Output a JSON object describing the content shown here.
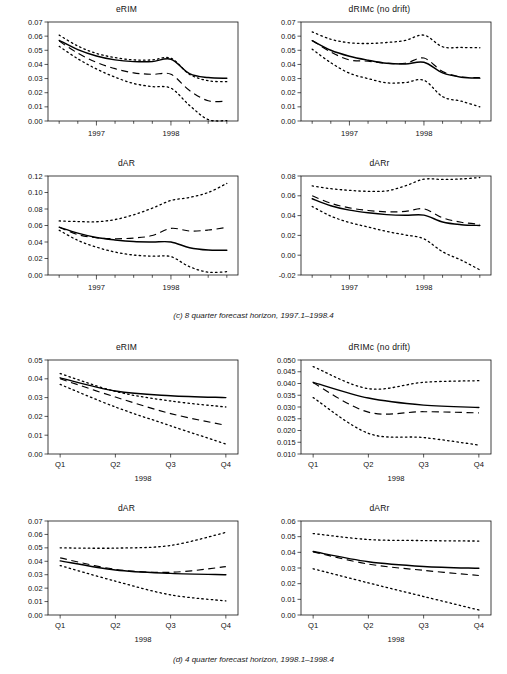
{
  "figure": {
    "captions": [
      "(c) 8 quarter forecast horizon, 1997.1–1998.4",
      "(d) 4 quarter forecast horizon, 1998.1–1998.4"
    ]
  },
  "chart_data": [
    {
      "id": "panel-c-erim",
      "type": "line",
      "title": "eRIM",
      "xlabel": "",
      "ylabel": "",
      "grid": false,
      "legend": "none",
      "x": [
        1996.5,
        1996.75,
        1997.0,
        1997.25,
        1997.5,
        1997.75,
        1998.0,
        1998.25,
        1998.5,
        1998.75
      ],
      "xtick_values": [
        1997.0,
        1998.0
      ],
      "xtick_labels": [
        "1997",
        "1998"
      ],
      "xlim": [
        1996.35,
        1998.9
      ],
      "ylim": [
        0.0,
        0.07
      ],
      "ytick_values": [
        0.0,
        0.01,
        0.02,
        0.03,
        0.04,
        0.05,
        0.06,
        0.07
      ],
      "ytick_labels": [
        "0.00",
        "0.01",
        "0.02",
        "0.03",
        "0.04",
        "0.05",
        "0.06",
        "0.07"
      ],
      "series": [
        {
          "name": "median",
          "style": "solid",
          "values": [
            0.057,
            0.0505,
            0.046,
            0.0432,
            0.042,
            0.042,
            0.0437,
            0.0335,
            0.0307,
            0.0302
          ]
        },
        {
          "name": "mean",
          "style": "dashed",
          "values": [
            0.0565,
            0.048,
            0.0415,
            0.037,
            0.034,
            0.033,
            0.033,
            0.0215,
            0.0143,
            0.014
          ]
        },
        {
          "name": "upper",
          "style": "dotted",
          "values": [
            0.0607,
            0.053,
            0.0478,
            0.0448,
            0.0432,
            0.0432,
            0.0444,
            0.033,
            0.0285,
            0.0278
          ]
        },
        {
          "name": "lower",
          "style": "dotted",
          "values": [
            0.0528,
            0.044,
            0.0368,
            0.031,
            0.0265,
            0.0243,
            0.0232,
            0.011,
            0.001,
            0.0003
          ]
        }
      ]
    },
    {
      "id": "panel-c-drimc",
      "type": "line",
      "title": "dRIMc (no drift)",
      "xlabel": "",
      "ylabel": "",
      "grid": false,
      "legend": "none",
      "x": [
        1996.5,
        1996.75,
        1997.0,
        1997.25,
        1997.5,
        1997.75,
        1998.0,
        1998.25,
        1998.5,
        1998.75
      ],
      "xtick_values": [
        1997.0,
        1998.0
      ],
      "xtick_labels": [
        "1997",
        "1998"
      ],
      "xlim": [
        1996.35,
        1998.9
      ],
      "ylim": [
        0.0,
        0.07
      ],
      "ytick_values": [
        0.0,
        0.01,
        0.02,
        0.03,
        0.04,
        0.05,
        0.06,
        0.07
      ],
      "ytick_labels": [
        "0.00",
        "0.01",
        "0.02",
        "0.03",
        "0.04",
        "0.05",
        "0.06",
        "0.07"
      ],
      "series": [
        {
          "name": "median",
          "style": "solid",
          "values": [
            0.0568,
            0.05,
            0.0458,
            0.043,
            0.0408,
            0.0403,
            0.0415,
            0.034,
            0.031,
            0.0303
          ]
        },
        {
          "name": "mean",
          "style": "dashed",
          "values": [
            0.057,
            0.0488,
            0.0432,
            0.0423,
            0.0408,
            0.0408,
            0.0445,
            0.035,
            0.0312,
            0.0307
          ]
        },
        {
          "name": "upper",
          "style": "dotted",
          "values": [
            0.063,
            0.0578,
            0.0553,
            0.0548,
            0.0555,
            0.057,
            0.0607,
            0.0525,
            0.052,
            0.0518
          ]
        },
        {
          "name": "lower",
          "style": "dotted",
          "values": [
            0.0508,
            0.0412,
            0.0338,
            0.03,
            0.027,
            0.0272,
            0.0288,
            0.0172,
            0.014,
            0.01
          ]
        }
      ]
    },
    {
      "id": "panel-c-dar",
      "type": "line",
      "title": "dAR",
      "xlabel": "",
      "ylabel": "",
      "grid": false,
      "legend": "none",
      "x": [
        1996.5,
        1996.75,
        1997.0,
        1997.25,
        1997.5,
        1997.75,
        1998.0,
        1998.25,
        1998.5,
        1998.75
      ],
      "xtick_values": [
        1997.0,
        1998.0
      ],
      "xtick_labels": [
        "1997",
        "1998"
      ],
      "xlim": [
        1996.35,
        1998.9
      ],
      "ylim": [
        0.0,
        0.12
      ],
      "ytick_values": [
        0.0,
        0.02,
        0.04,
        0.06,
        0.08,
        0.1,
        0.12
      ],
      "ytick_labels": [
        "0.00",
        "0.02",
        "0.04",
        "0.06",
        "0.08",
        "0.10",
        "0.12"
      ],
      "series": [
        {
          "name": "median",
          "style": "solid",
          "values": [
            0.058,
            0.0508,
            0.0455,
            0.0425,
            0.0405,
            0.04,
            0.04,
            0.033,
            0.0302,
            0.03
          ]
        },
        {
          "name": "mean",
          "style": "dashed",
          "values": [
            0.0578,
            0.049,
            0.0452,
            0.044,
            0.0448,
            0.0478,
            0.0565,
            0.0533,
            0.0545,
            0.0578
          ]
        },
        {
          "name": "upper",
          "style": "dotted",
          "values": [
            0.0655,
            0.0648,
            0.0645,
            0.0672,
            0.073,
            0.081,
            0.0903,
            0.094,
            0.1,
            0.111
          ]
        },
        {
          "name": "lower",
          "style": "dotted",
          "values": [
            0.0542,
            0.042,
            0.0338,
            0.0278,
            0.0242,
            0.0228,
            0.0222,
            0.01,
            0.0035,
            0.004
          ]
        }
      ]
    },
    {
      "id": "panel-c-darr",
      "type": "line",
      "title": "dARr",
      "xlabel": "",
      "ylabel": "",
      "grid": false,
      "legend": "none",
      "x": [
        1996.5,
        1996.75,
        1997.0,
        1997.25,
        1997.5,
        1997.75,
        1998.0,
        1998.25,
        1998.5,
        1998.75
      ],
      "xtick_values": [
        1997.0,
        1998.0
      ],
      "xtick_labels": [
        "1997",
        "1998"
      ],
      "xlim": [
        1996.35,
        1998.9
      ],
      "ylim": [
        -0.02,
        0.08
      ],
      "ytick_values": [
        -0.02,
        0.0,
        0.02,
        0.04,
        0.06,
        0.08
      ],
      "ytick_labels": [
        "-0.02",
        "0.00",
        "0.02",
        "0.04",
        "0.06",
        "0.08"
      ],
      "series": [
        {
          "name": "median",
          "style": "solid",
          "values": [
            0.057,
            0.05,
            0.0455,
            0.0428,
            0.041,
            0.0403,
            0.0405,
            0.0335,
            0.0308,
            0.03
          ]
        },
        {
          "name": "mean",
          "style": "dashed",
          "values": [
            0.06,
            0.0525,
            0.0478,
            0.0452,
            0.0438,
            0.0442,
            0.0468,
            0.0378,
            0.0333,
            0.0312
          ]
        },
        {
          "name": "upper",
          "style": "dotted",
          "values": [
            0.07,
            0.0672,
            0.0655,
            0.0645,
            0.065,
            0.07,
            0.0768,
            0.0765,
            0.077,
            0.0785
          ]
        },
        {
          "name": "lower",
          "style": "dotted",
          "values": [
            0.0492,
            0.0395,
            0.033,
            0.0285,
            0.024,
            0.0205,
            0.0165,
            0.0035,
            -0.005,
            -0.0148
          ]
        }
      ]
    },
    {
      "id": "panel-d-erim",
      "type": "line",
      "title": "eRIM",
      "xlabel": "1998",
      "ylabel": "",
      "grid": false,
      "legend": "none",
      "x": [
        1,
        2,
        3,
        4
      ],
      "xtick_values": [
        1,
        2,
        3,
        4
      ],
      "xtick_labels": [
        "Q1",
        "Q2",
        "Q3",
        "Q4"
      ],
      "xlim": [
        0.78,
        4.22
      ],
      "ylim": [
        0.0,
        0.05
      ],
      "ytick_values": [
        0.0,
        0.01,
        0.02,
        0.03,
        0.04,
        0.05
      ],
      "ytick_labels": [
        "0.00",
        "0.01",
        "0.02",
        "0.03",
        "0.04",
        "0.05"
      ],
      "series": [
        {
          "name": "median",
          "style": "solid",
          "values": [
            0.0405,
            0.0335,
            0.031,
            0.03
          ]
        },
        {
          "name": "mean",
          "style": "dashed",
          "values": [
            0.04,
            0.0303,
            0.0215,
            0.0152
          ]
        },
        {
          "name": "upper",
          "style": "dotted",
          "values": [
            0.0428,
            0.0333,
            0.0282,
            0.025
          ]
        },
        {
          "name": "lower",
          "style": "dotted",
          "values": [
            0.037,
            0.025,
            0.015,
            0.0053
          ]
        }
      ]
    },
    {
      "id": "panel-d-drimc",
      "type": "line",
      "title": "dRIMc (no drift)",
      "xlabel": "1998",
      "ylabel": "",
      "grid": false,
      "legend": "none",
      "x": [
        1,
        2,
        3,
        4
      ],
      "xtick_values": [
        1,
        2,
        3,
        4
      ],
      "xtick_labels": [
        "Q1",
        "Q2",
        "Q3",
        "Q4"
      ],
      "xlim": [
        0.78,
        4.22
      ],
      "ylim": [
        0.01,
        0.05
      ],
      "ytick_values": [
        0.01,
        0.015,
        0.02,
        0.025,
        0.03,
        0.035,
        0.04,
        0.045,
        0.05
      ],
      "ytick_labels": [
        "0.010",
        "0.015",
        "0.020",
        "0.025",
        "0.030",
        "0.035",
        "0.040",
        "0.045",
        "0.050"
      ],
      "series": [
        {
          "name": "median",
          "style": "solid",
          "values": [
            0.0405,
            0.0338,
            0.0308,
            0.0298
          ]
        },
        {
          "name": "mean",
          "style": "dashed",
          "values": [
            0.0403,
            0.0278,
            0.028,
            0.0275
          ]
        },
        {
          "name": "upper",
          "style": "dotted",
          "values": [
            0.0472,
            0.0378,
            0.0405,
            0.0412
          ]
        },
        {
          "name": "lower",
          "style": "dotted",
          "values": [
            0.034,
            0.0188,
            0.017,
            0.0138
          ]
        }
      ]
    },
    {
      "id": "panel-d-dar",
      "type": "line",
      "title": "dAR",
      "xlabel": "1998",
      "ylabel": "",
      "grid": false,
      "legend": "none",
      "x": [
        1,
        2,
        3,
        4
      ],
      "xtick_values": [
        1,
        2,
        3,
        4
      ],
      "xtick_labels": [
        "Q1",
        "Q2",
        "Q3",
        "Q4"
      ],
      "xlim": [
        0.78,
        4.22
      ],
      "ylim": [
        0.0,
        0.07
      ],
      "ytick_values": [
        0.0,
        0.01,
        0.02,
        0.03,
        0.04,
        0.05,
        0.06,
        0.07
      ],
      "ytick_labels": [
        "0.00",
        "0.01",
        "0.02",
        "0.03",
        "0.04",
        "0.05",
        "0.06",
        "0.07"
      ],
      "series": [
        {
          "name": "median",
          "style": "solid",
          "values": [
            0.0403,
            0.0335,
            0.031,
            0.03
          ]
        },
        {
          "name": "mean",
          "style": "dashed",
          "values": [
            0.0425,
            0.034,
            0.0318,
            0.036
          ]
        },
        {
          "name": "upper",
          "style": "dotted",
          "values": [
            0.05,
            0.0498,
            0.0518,
            0.0615
          ]
        },
        {
          "name": "lower",
          "style": "dotted",
          "values": [
            0.0368,
            0.0252,
            0.015,
            0.0105
          ]
        }
      ]
    },
    {
      "id": "panel-d-darr",
      "type": "line",
      "title": "dARr",
      "xlabel": "1998",
      "ylabel": "",
      "grid": false,
      "legend": "none",
      "x": [
        1,
        2,
        3,
        4
      ],
      "xtick_values": [
        1,
        2,
        3,
        4
      ],
      "xtick_labels": [
        "Q1",
        "Q2",
        "Q3",
        "Q4"
      ],
      "xlim": [
        0.78,
        4.22
      ],
      "ylim": [
        0.0,
        0.06
      ],
      "ytick_values": [
        0.0,
        0.01,
        0.02,
        0.03,
        0.04,
        0.05,
        0.06
      ],
      "ytick_labels": [
        "0.00",
        "0.01",
        "0.02",
        "0.03",
        "0.04",
        "0.05",
        "0.06"
      ],
      "series": [
        {
          "name": "median",
          "style": "solid",
          "values": [
            0.0405,
            0.034,
            0.031,
            0.0298
          ]
        },
        {
          "name": "mean",
          "style": "dashed",
          "values": [
            0.0403,
            0.0325,
            0.0285,
            0.0252
          ]
        },
        {
          "name": "upper",
          "style": "dotted",
          "values": [
            0.052,
            0.0482,
            0.0475,
            0.0472
          ]
        },
        {
          "name": "lower",
          "style": "dotted",
          "values": [
            0.0295,
            0.0205,
            0.0118,
            0.0032
          ]
        }
      ]
    }
  ]
}
